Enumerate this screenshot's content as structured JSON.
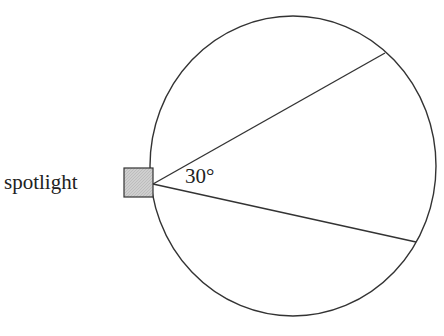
{
  "diagram": {
    "spotlight_label": "spotlight",
    "angle_label": "30°",
    "colors": {
      "stroke": "#333333",
      "spotlight_fill": "#c8c8c8"
    }
  }
}
